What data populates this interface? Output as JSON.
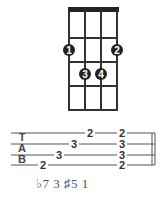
{
  "chord_diagram": {
    "strings": 4,
    "frets": 4,
    "fingers": [
      {
        "label": "1",
        "string": 1,
        "fret": 2
      },
      {
        "label": "2",
        "string": 4,
        "fret": 2
      },
      {
        "label": "3",
        "string": 2,
        "fret": 3
      },
      {
        "label": "4",
        "string": 3,
        "fret": 3
      }
    ]
  },
  "tab": {
    "clef": [
      "T",
      "A",
      "B"
    ],
    "notes": [
      {
        "line": 4,
        "fret": "2"
      },
      {
        "line": 3,
        "fret": "3"
      },
      {
        "line": 2,
        "fret": "3"
      },
      {
        "line": 1,
        "fret": "2"
      }
    ],
    "chord": [
      "2",
      "3",
      "3",
      "2"
    ]
  },
  "intervals": "♭7 3 ♯5 1",
  "colors": {
    "ink": "#222222",
    "line": "#555555",
    "text_gray": "#555555"
  }
}
